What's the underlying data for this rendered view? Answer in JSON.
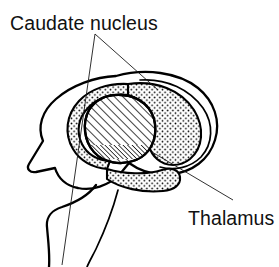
{
  "figure": {
    "kind": "anatomical-line-diagram",
    "width": 279,
    "height": 267,
    "background_color": "#ffffff",
    "ink_color": "#000000"
  },
  "labels": [
    {
      "id": "caudate-nucleus",
      "text": "Caudate nucleus",
      "x": 10,
      "y": 30,
      "anchor": "start",
      "font_size": 19.5
    },
    {
      "id": "thalamus",
      "text": "Thalamus",
      "x": 188,
      "y": 225,
      "anchor": "start",
      "font_size": 19.5
    }
  ],
  "leader_lines": [
    {
      "id": "caudate-leader-left",
      "from_label": "caudate-nucleus",
      "points": "95,34 62,265"
    },
    {
      "id": "caudate-leader-right",
      "from_label": "caudate-nucleus",
      "points": "95,34 158,90"
    },
    {
      "id": "thalamus-leader",
      "from_label": "thalamus",
      "points": "233,200 152,152"
    }
  ],
  "structures": [
    {
      "id": "thalamus-region",
      "name": "Thalamus",
      "pattern": "diagonal-hatch",
      "accent_color": "#000000"
    },
    {
      "id": "caudate-nucleus-region",
      "name": "Caudate nucleus",
      "pattern": "stipple-dots",
      "accent_color": "#000000"
    },
    {
      "id": "cerebral-outline",
      "name": "Cerebral hemisphere outline",
      "pattern": "outline",
      "accent_color": "#000000"
    },
    {
      "id": "brainstem-outline",
      "name": "Brainstem outline",
      "pattern": "outline",
      "accent_color": "#000000"
    }
  ]
}
